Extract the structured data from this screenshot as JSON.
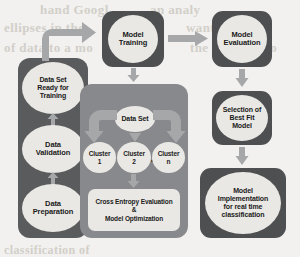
{
  "diagram": {
    "colors": {
      "panel_dark": "#5a5b5d",
      "panel_mid": "#88898c",
      "box_dark": "#4e4f51",
      "node_fill": "#e9e8e4",
      "arrow": "#a6a7a9",
      "background": "#f2f1ef",
      "text": "#1b1b1b"
    },
    "data_pipeline": {
      "panel_name": "data-preparation-panel",
      "steps": [
        {
          "label": "Data Set\nReady for\nTraining",
          "line1": "Data Set",
          "line2": "Ready for",
          "line3": "Training"
        },
        {
          "label": "Data Validation",
          "line1": "Data",
          "line2": "Validation",
          "line3": ""
        },
        {
          "label": "Data Preparation",
          "line1": "Data",
          "line2": "Preparation",
          "line3": ""
        }
      ]
    },
    "training": {
      "label": "Model Training",
      "line1": "Model",
      "line2": "Training"
    },
    "evaluation": {
      "label": "Model Evaluation",
      "line1": "Model",
      "line2": "Evaluation"
    },
    "best_fit": {
      "label": "Selection of Best Fit Model",
      "line1": "Selection of",
      "line2": "Best Fit",
      "line3": "Model"
    },
    "implementation": {
      "label": "Model Implementation for real time classification",
      "line1": "Model",
      "line2": "Implementation",
      "line3": "for real time",
      "line4": "classification"
    },
    "clustering": {
      "panel_name": "clustering-panel",
      "source": {
        "label": "Data Set"
      },
      "clusters": [
        {
          "line1": "Cluster",
          "line2": "1"
        },
        {
          "line1": "Cluster",
          "line2": "2"
        },
        {
          "line1": "Cluster",
          "line2": "n"
        }
      ],
      "ellipsis": "•••",
      "output": {
        "line1": "Cross Entropy Evaluation",
        "line2": "&",
        "line3": "Model Optimization"
      }
    },
    "background_text": {
      "l1": "hand Googl",
      "l2": "an analy",
      "l3": "ellipses in the",
      "l4": "wanting",
      "l5": "of data to a mo",
      "l6": "the trained mo",
      "l7": "classification of"
    }
  }
}
